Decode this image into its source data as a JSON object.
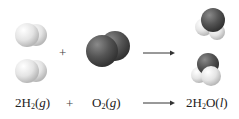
{
  "diagram": {
    "molecule_row": {
      "plus": "+",
      "reactant_1": {
        "name": "hydrogen",
        "count": 2,
        "color": "#e6e6e6"
      },
      "reactant_2": {
        "name": "oxygen",
        "count": 1,
        "color": "#555555"
      },
      "product": {
        "name": "water",
        "count": 2,
        "colors": {
          "O": "#555555",
          "H": "#e6e6e6"
        }
      }
    },
    "equation": {
      "r1": {
        "coef": "2",
        "sym": "H",
        "sub": "2",
        "open": "(",
        "state": "g",
        "close": ")"
      },
      "plus": "+",
      "r2": {
        "coef": "",
        "sym": "O",
        "sub": "2",
        "open": "(",
        "state": "g",
        "close": ")"
      },
      "p1": {
        "coef": "2",
        "sym1": "H",
        "sub": "2",
        "sym2": "O",
        "open": "(",
        "state": "l",
        "close": ")"
      }
    }
  }
}
